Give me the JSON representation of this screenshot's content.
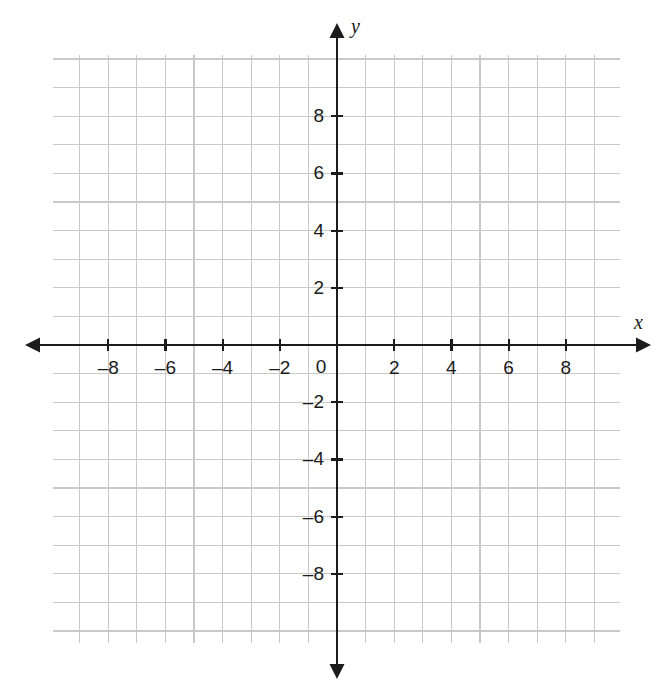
{
  "chart_data": {
    "type": "scatter",
    "title": "",
    "subtitle": "",
    "xlabel": "x",
    "ylabel": "y",
    "xlim": [
      -9.9,
      9.9
    ],
    "ylim": [
      -10.4,
      10.1
    ],
    "grid": true,
    "grid_step": 1,
    "legend": false,
    "series": [],
    "x_tick_labels": [
      "–8",
      "–6",
      "–4",
      "–2",
      "0",
      "2",
      "4",
      "6",
      "8"
    ],
    "x_tick_values": [
      -8,
      -6,
      -4,
      -2,
      0,
      2,
      4,
      6,
      8
    ],
    "y_tick_labels": [
      "8",
      "6",
      "4",
      "2",
      "–2",
      "–4",
      "–6",
      "–8"
    ],
    "y_tick_values": [
      8,
      6,
      4,
      2,
      -2,
      -4,
      -6,
      -8
    ],
    "origin_label": "0",
    "data_points": [],
    "annotations": []
  },
  "axes": {
    "x_axis_name": "x",
    "y_axis_name": "y",
    "origin_label": "0"
  },
  "colors": {
    "grid_line": "#c9c9c9",
    "axis": "#1c1c1c",
    "label": "#1a1a1a",
    "background": "#ffffff"
  },
  "geometry": {
    "origin_x": 337,
    "origin_y": 345,
    "unit_px": 28.6,
    "grid_left": 53,
    "grid_right": 620,
    "grid_top": 55,
    "grid_bottom": 643
  }
}
